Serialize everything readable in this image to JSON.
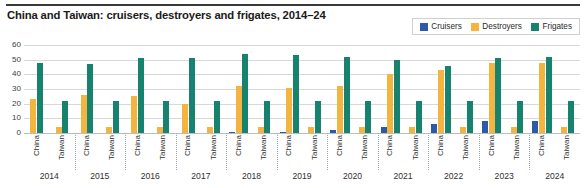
{
  "title": "China and Taiwan: cruisers, destroyers and frigates, 2014–24",
  "legend": {
    "position": "top-right",
    "items": [
      {
        "label": "Cruisers",
        "color": "#2c5aa8",
        "icon": "square-swatch-icon"
      },
      {
        "label": "Destroyers",
        "color": "#f3b53f",
        "icon": "square-swatch-icon"
      },
      {
        "label": "Frigates",
        "color": "#17836f",
        "icon": "square-swatch-icon"
      }
    ]
  },
  "axis": {
    "y_ticks": [
      "0",
      "10",
      "20",
      "30",
      "40",
      "50",
      "60"
    ],
    "ylim": [
      0,
      60
    ],
    "entities": [
      "China",
      "Taiwan"
    ],
    "years": [
      "2014",
      "2015",
      "2016",
      "2017",
      "2018",
      "2019",
      "2020",
      "2021",
      "2022",
      "2023",
      "2024"
    ]
  },
  "chart_data": {
    "type": "bar",
    "title": "China and Taiwan: cruisers, destroyers and frigates, 2014–24",
    "xlabel": "",
    "ylabel": "",
    "ylim": [
      0,
      60
    ],
    "grid": true,
    "legend_position": "top-right",
    "categories": [
      "2014 China",
      "2014 Taiwan",
      "2015 China",
      "2015 Taiwan",
      "2016 China",
      "2016 Taiwan",
      "2017 China",
      "2017 Taiwan",
      "2018 China",
      "2018 Taiwan",
      "2019 China",
      "2019 Taiwan",
      "2020 China",
      "2020 Taiwan",
      "2021 China",
      "2021 Taiwan",
      "2022 China",
      "2022 Taiwan",
      "2023 China",
      "2023 Taiwan",
      "2024 China",
      "2024 Taiwan"
    ],
    "series": [
      {
        "name": "Cruisers",
        "color": "#2c5aa8",
        "values": [
          0,
          0,
          0,
          0,
          0,
          0,
          0,
          0,
          1,
          0,
          1,
          0,
          2,
          0,
          4,
          0,
          6,
          0,
          8,
          0,
          8,
          0
        ]
      },
      {
        "name": "Destroyers",
        "color": "#f3b53f",
        "values": [
          23,
          4,
          26,
          4,
          25,
          4,
          20,
          4,
          32,
          4,
          31,
          4,
          32,
          4,
          40,
          4,
          43,
          4,
          48,
          4,
          48,
          4
        ]
      },
      {
        "name": "Frigates",
        "color": "#17836f",
        "values": [
          48,
          22,
          47,
          22,
          51,
          22,
          51,
          22,
          54,
          22,
          53,
          22,
          52,
          22,
          50,
          22,
          46,
          22,
          51,
          22,
          52,
          22
        ]
      }
    ],
    "groups": [
      {
        "year": "2014",
        "entities": [
          {
            "name": "China",
            "cruisers": 0,
            "destroyers": 23,
            "frigates": 48
          },
          {
            "name": "Taiwan",
            "cruisers": 0,
            "destroyers": 4,
            "frigates": 22
          }
        ]
      },
      {
        "year": "2015",
        "entities": [
          {
            "name": "China",
            "cruisers": 0,
            "destroyers": 26,
            "frigates": 47
          },
          {
            "name": "Taiwan",
            "cruisers": 0,
            "destroyers": 4,
            "frigates": 22
          }
        ]
      },
      {
        "year": "2016",
        "entities": [
          {
            "name": "China",
            "cruisers": 0,
            "destroyers": 25,
            "frigates": 51
          },
          {
            "name": "Taiwan",
            "cruisers": 0,
            "destroyers": 4,
            "frigates": 22
          }
        ]
      },
      {
        "year": "2017",
        "entities": [
          {
            "name": "China",
            "cruisers": 0,
            "destroyers": 20,
            "frigates": 51
          },
          {
            "name": "Taiwan",
            "cruisers": 0,
            "destroyers": 4,
            "frigates": 22
          }
        ]
      },
      {
        "year": "2018",
        "entities": [
          {
            "name": "China",
            "cruisers": 1,
            "destroyers": 32,
            "frigates": 54
          },
          {
            "name": "Taiwan",
            "cruisers": 0,
            "destroyers": 4,
            "frigates": 22
          }
        ]
      },
      {
        "year": "2019",
        "entities": [
          {
            "name": "China",
            "cruisers": 1,
            "destroyers": 31,
            "frigates": 53
          },
          {
            "name": "Taiwan",
            "cruisers": 0,
            "destroyers": 4,
            "frigates": 22
          }
        ]
      },
      {
        "year": "2020",
        "entities": [
          {
            "name": "China",
            "cruisers": 2,
            "destroyers": 32,
            "frigates": 52
          },
          {
            "name": "Taiwan",
            "cruisers": 0,
            "destroyers": 4,
            "frigates": 22
          }
        ]
      },
      {
        "year": "2021",
        "entities": [
          {
            "name": "China",
            "cruisers": 4,
            "destroyers": 40,
            "frigates": 50
          },
          {
            "name": "Taiwan",
            "cruisers": 0,
            "destroyers": 4,
            "frigates": 22
          }
        ]
      },
      {
        "year": "2022",
        "entities": [
          {
            "name": "China",
            "cruisers": 6,
            "destroyers": 43,
            "frigates": 46
          },
          {
            "name": "Taiwan",
            "cruisers": 0,
            "destroyers": 4,
            "frigates": 22
          }
        ]
      },
      {
        "year": "2023",
        "entities": [
          {
            "name": "China",
            "cruisers": 8,
            "destroyers": 48,
            "frigates": 51
          },
          {
            "name": "Taiwan",
            "cruisers": 0,
            "destroyers": 4,
            "frigates": 22
          }
        ]
      },
      {
        "year": "2024",
        "entities": [
          {
            "name": "China",
            "cruisers": 8,
            "destroyers": 48,
            "frigates": 52
          },
          {
            "name": "Taiwan",
            "cruisers": 0,
            "destroyers": 4,
            "frigates": 22
          }
        ]
      }
    ]
  }
}
